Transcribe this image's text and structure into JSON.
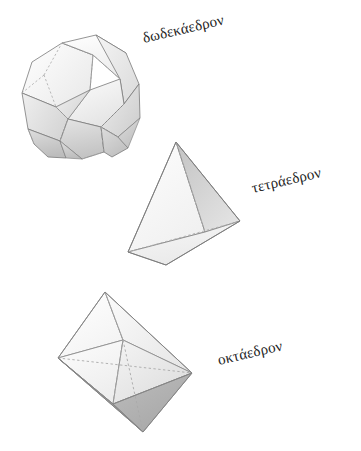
{
  "page": {
    "background_color": "#ffffff",
    "width": 361,
    "height": 451
  },
  "figure": {
    "title": "",
    "caption": ""
  },
  "solids": [
    {
      "id": "dodecahedron",
      "label": "δωδεκάεδρον",
      "label_rotation_deg": -13,
      "face_light_color": "#f7f7f7",
      "face_mid_color": "#dcdcdc",
      "face_dark_color": "#bdbdbd",
      "edge_color": "#6e6e6e",
      "hidden_edge_color": "#a8a8a8",
      "hidden_edge_style": "dashed"
    },
    {
      "id": "tetrahedron",
      "label": "τετράεδρον",
      "label_rotation_deg": -13,
      "face_light_color": "#fbfbfb",
      "face_mid_color": "#efefef",
      "face_dark_color": "#c6c6c6",
      "edge_color": "#8a8a8a",
      "hidden_edge_color": "#b0b0b0",
      "hidden_edge_style": "dashed"
    },
    {
      "id": "octahedron",
      "label": "οκτάεδρον",
      "label_rotation_deg": -13,
      "face_light_color": "#fcfcfc",
      "face_mid_color": "#ededed",
      "face_dark_color": "#9c9c9c",
      "edge_color": "#8f8f8f",
      "hidden_edge_color": "#a9a9a9",
      "hidden_edge_style": "dashed"
    }
  ]
}
